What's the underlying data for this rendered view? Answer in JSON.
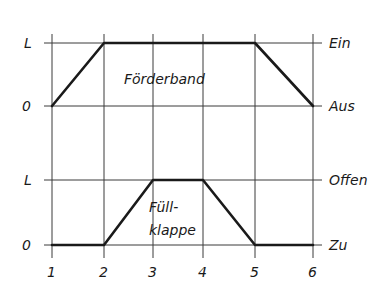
{
  "diagram": {
    "type": "timing-diagram",
    "x_ticks": [
      "1",
      "2",
      "3",
      "4",
      "5",
      "6"
    ],
    "top": {
      "name": "Förderband",
      "left_labels": {
        "high": "L",
        "low": "0"
      },
      "right_labels": {
        "high": "Ein",
        "low": "Aus"
      },
      "signal": [
        [
          1,
          0
        ],
        [
          2,
          1
        ],
        [
          5,
          1
        ],
        [
          6,
          0
        ]
      ]
    },
    "bottom": {
      "name_line1": "Füll-",
      "name_line2": "klappe",
      "left_labels": {
        "high": "L",
        "low": "0"
      },
      "right_labels": {
        "high": "Offen",
        "low": "Zu"
      },
      "signal": [
        [
          1,
          0
        ],
        [
          2,
          0
        ],
        [
          3,
          1
        ],
        [
          4,
          1
        ],
        [
          5,
          0
        ],
        [
          6,
          0
        ]
      ]
    }
  }
}
